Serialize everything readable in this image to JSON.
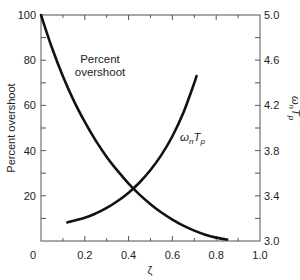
{
  "chart_data": {
    "type": "line",
    "title": "",
    "xlabel": "ζ",
    "ylabel": "Percent overshoot",
    "y2label": "ωnTp",
    "xlim": [
      0,
      1.0
    ],
    "ylim": [
      0,
      100
    ],
    "y2lim": [
      3.0,
      5.0
    ],
    "grid": false,
    "x_ticks": [
      "0",
      "0.2",
      "0.4",
      "0.6",
      "0.8",
      "1.0"
    ],
    "y_ticks": [
      "20",
      "40",
      "60",
      "80",
      "100"
    ],
    "y2_ticks": [
      "3.0",
      "3.4",
      "3.8",
      "4.2",
      "4.6",
      "5.0"
    ],
    "series": [
      {
        "name": "Percent overshoot",
        "axis": "left",
        "x": [
          0,
          0.05,
          0.1,
          0.15,
          0.2,
          0.25,
          0.3,
          0.35,
          0.4,
          0.45,
          0.5,
          0.55,
          0.6,
          0.65,
          0.7,
          0.75,
          0.8,
          0.85
        ],
        "values": [
          100,
          85.5,
          72.9,
          62.0,
          52.7,
          44.4,
          37.2,
          31.0,
          25.4,
          20.5,
          16.3,
          12.6,
          9.5,
          6.8,
          4.6,
          2.8,
          1.5,
          0.6
        ]
      },
      {
        "name": "ωnTp",
        "axis": "right",
        "x": [
          0.12,
          0.2,
          0.25,
          0.3,
          0.35,
          0.4,
          0.45,
          0.5,
          0.55,
          0.6,
          0.65,
          0.7,
          0.71
        ],
        "values": [
          3.164,
          3.206,
          3.244,
          3.293,
          3.354,
          3.428,
          3.518,
          3.628,
          3.762,
          3.927,
          4.134,
          4.399,
          4.46
        ]
      }
    ],
    "annotations": [
      {
        "text": "Percent overshoot",
        "near_series": "Percent overshoot"
      },
      {
        "text": "ωnTp",
        "near_series": "ωnTp"
      }
    ]
  },
  "labels": {
    "xlabel": "ζ",
    "ylabel": "Percent overshoot",
    "y2label_main": "ω",
    "y2label_sub_n": "n",
    "y2label_T": "T",
    "y2label_sub_p": "p",
    "annot_po_line1": "Percent",
    "annot_po_line2": "overshoot",
    "annot_wn_main": "ω",
    "annot_wn_sub": "n",
    "annot_T": "T",
    "annot_T_sub": "p"
  },
  "colors": {
    "line": "#111111",
    "axis": "#555555"
  }
}
